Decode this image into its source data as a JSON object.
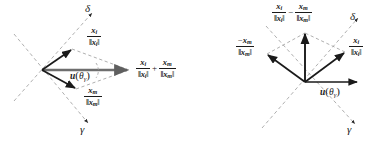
{
  "figure": {
    "name": "vector-sum-and-difference-diagram",
    "background_color": "#ffffff",
    "stroke_color": "#1a1a1a",
    "dashed_color": "#9a9a9a",
    "thick_vector_color": "#6e6e6e"
  },
  "symbols": {
    "delta": "δ",
    "gamma": "γ",
    "theta": "θ",
    "x": "x",
    "i": "i",
    "m": "m",
    "u": "u",
    "plus": "+",
    "minus": "−",
    "neg": "−",
    "bar_left": "‖",
    "bar_right": "‖",
    "paren_open": "(",
    "paren_close": ")"
  },
  "left_diagram": {
    "name": "sum-diagram",
    "axis_labels": {
      "delta": "δ",
      "gamma": "γ"
    },
    "vectors": [
      {
        "name": "unit-vector-xi",
        "label_num": "x",
        "label_num_sub": "i",
        "label_den": "‖x",
        "label_den_sub": "i",
        "label_den_close": "‖",
        "direction": "up-right"
      },
      {
        "name": "unit-vector-xm",
        "label_num": "x",
        "label_num_sub": "m",
        "label_den": "‖x",
        "label_den_sub": "m",
        "label_den_close": "‖",
        "direction": "down-right"
      },
      {
        "name": "sum-vector",
        "direction": "right",
        "style": "thick-gray"
      }
    ],
    "direction_label": {
      "name": "u-theta-gamma",
      "u": "u",
      "open": "(",
      "theta": "θ",
      "sub": "γ",
      "close": ")"
    },
    "sum_label": {
      "name": "sum-expression",
      "term1_num": "x",
      "term1_num_sub": "i",
      "term1_den_open": "‖x",
      "term1_den_sub": "i",
      "term1_den_close": "‖",
      "operator": "+",
      "term2_num": "x",
      "term2_num_sub": "m",
      "term2_den_open": "‖x",
      "term2_den_sub": "m",
      "term2_den_close": "‖"
    }
  },
  "right_diagram": {
    "name": "difference-diagram",
    "axis_labels": {
      "delta": "δ",
      "gamma": "γ"
    },
    "vectors": [
      {
        "name": "unit-vector-xi",
        "label_num": "x",
        "label_num_sub": "i",
        "label_den": "‖x",
        "label_den_sub": "i",
        "label_den_close": "‖",
        "direction": "up-right"
      },
      {
        "name": "negative-unit-vector-xm",
        "sign": "−",
        "label_num": "x",
        "label_num_sub": "m",
        "label_den": "‖x",
        "label_den_sub": "m",
        "label_den_close": "‖",
        "direction": "up-left"
      },
      {
        "name": "difference-vector",
        "direction": "up"
      },
      {
        "name": "reference-direction-vector",
        "direction": "right"
      }
    ],
    "direction_label": {
      "name": "u-theta-gamma",
      "u": "u",
      "open": "(",
      "theta": "θ",
      "sub": "γ",
      "close": ")"
    },
    "difference_label": {
      "name": "difference-expression",
      "term1_num": "x",
      "term1_num_sub": "i",
      "term1_den_open": "‖x",
      "term1_den_sub": "i",
      "term1_den_close": "‖",
      "operator": "−",
      "term2_num": "x",
      "term2_num_sub": "m",
      "term2_den_open": "‖x",
      "term2_den_sub": "m",
      "term2_den_close": "‖"
    }
  }
}
